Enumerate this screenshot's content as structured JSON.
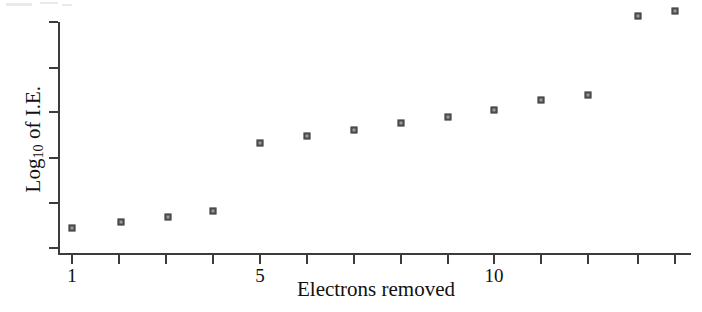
{
  "figure": {
    "background_color": "#ffffff",
    "axis_color": "#3c3c3c",
    "marker_edge_color": "#4a4a4a",
    "marker_face_color": "#9a9a9a"
  },
  "axis_titles": {
    "x": "Electrons removed",
    "y_prefix": "Log",
    "y_subscript": "10",
    "y_suffix": " of I.E."
  },
  "x_tick_labels": {
    "t1": "1",
    "t5": "5",
    "t10": "10"
  },
  "chart_data": {
    "type": "scatter",
    "title": "",
    "xlabel": "Electrons removed",
    "ylabel": "Log10 of I.E.",
    "grid": false,
    "legend": null,
    "xlim": [
      0.7,
      14.5
    ],
    "ylim": [
      0,
      6
    ],
    "x_ticks": [
      1,
      2,
      3,
      4,
      5,
      6,
      7,
      8,
      9,
      10,
      11,
      12,
      13,
      14
    ],
    "x_tick_labels": [
      "1",
      "",
      "",
      "",
      "5",
      "",
      "",
      "",
      "",
      "10",
      "",
      "",
      "",
      ""
    ],
    "y_ticks": [
      0,
      1,
      2,
      3,
      4,
      5
    ],
    "y_tick_labels": [
      "",
      "",
      "",
      "",
      "",
      ""
    ],
    "x": [
      1,
      2,
      3,
      4,
      5,
      6,
      7,
      8,
      9,
      10,
      11,
      12,
      13,
      14
    ],
    "y": [
      0.57,
      0.7,
      0.81,
      0.94,
      2.4,
      2.55,
      2.68,
      2.83,
      2.96,
      3.11,
      3.32,
      3.43,
      5.14,
      5.25
    ],
    "series": [
      {
        "name": "Log10 of I.E.",
        "marker": "square",
        "values": [
          0.57,
          0.7,
          0.81,
          0.94,
          2.4,
          2.55,
          2.68,
          2.83,
          2.96,
          3.11,
          3.32,
          3.43,
          5.14,
          5.25
        ]
      }
    ],
    "points_px": [
      {
        "electron": 1,
        "x": 72,
        "y": 228
      },
      {
        "electron": 2,
        "x": 121,
        "y": 222
      },
      {
        "electron": 3,
        "x": 168,
        "y": 217
      },
      {
        "electron": 4,
        "x": 213,
        "y": 211
      },
      {
        "electron": 5,
        "x": 260,
        "y": 143
      },
      {
        "electron": 6,
        "x": 307,
        "y": 136
      },
      {
        "electron": 7,
        "x": 354,
        "y": 130
      },
      {
        "electron": 8,
        "x": 401,
        "y": 123
      },
      {
        "electron": 9,
        "x": 448,
        "y": 117
      },
      {
        "electron": 10,
        "x": 494,
        "y": 110
      },
      {
        "electron": 11,
        "x": 541,
        "y": 100
      },
      {
        "electron": 12,
        "x": 588,
        "y": 95
      },
      {
        "electron": 13,
        "x": 638,
        "y": 16
      },
      {
        "electron": 14,
        "x": 675,
        "y": 11
      }
    ],
    "x_ticks_px": [
      72,
      119,
      166,
      213,
      260,
      307,
      354,
      401,
      448,
      494,
      541,
      588,
      638,
      675
    ],
    "y_ticks_px": [
      22,
      68,
      112,
      158,
      203,
      248
    ]
  }
}
